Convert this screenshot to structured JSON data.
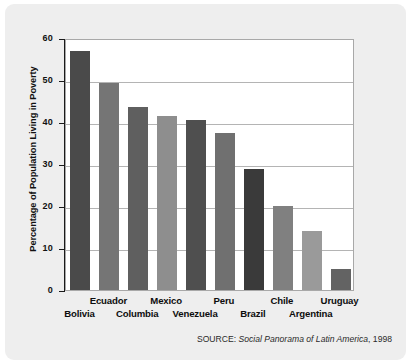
{
  "chart_data": {
    "type": "bar",
    "title": "",
    "xlabel": "",
    "ylabel": "Percentage of Population Living in Poverty",
    "ylim": [
      0,
      60
    ],
    "yticks": [
      "0",
      "10",
      "20",
      "30",
      "40",
      "50",
      "60"
    ],
    "grid": true,
    "legend": "none",
    "categories": [
      "Bolivia",
      "Ecuador",
      "Columbia",
      "Mexico",
      "Venezuela",
      "Peru",
      "Brazil",
      "Chile",
      "Argentina",
      "Uruguay"
    ],
    "values": [
      57.0,
      49.3,
      43.5,
      41.5,
      40.5,
      37.5,
      28.8,
      20.0,
      14.0,
      5.0
    ],
    "bar_colors": [
      "#4a4a4a",
      "#757575",
      "#5f5f5f",
      "#8e8e8e",
      "#4f4f4f",
      "#707070",
      "#3a3a3a",
      "#808080",
      "#9a9a9a",
      "#636363"
    ],
    "source": {
      "prefix": "SOURCE: ",
      "title": "Social Panorama of Latin America",
      "suffix": ", 1998"
    }
  },
  "labels": {
    "rows": [
      {
        "name": "Bolivia",
        "row": "bot"
      },
      {
        "name": "Ecuador",
        "row": "top"
      },
      {
        "name": "Columbia",
        "row": "bot"
      },
      {
        "name": "Mexico",
        "row": "top"
      },
      {
        "name": "Venezuela",
        "row": "bot"
      },
      {
        "name": "Peru",
        "row": "top"
      },
      {
        "name": "Brazil",
        "row": "bot"
      },
      {
        "name": "Chile",
        "row": "top"
      },
      {
        "name": "Argentina",
        "row": "bot"
      },
      {
        "name": "Uruguay",
        "row": "top"
      }
    ]
  },
  "style": {
    "card_bg": "#eeeeee",
    "panel_bg": "#ffffff",
    "grid_color": "#b4b4b4",
    "axis_color": "#1a1a1a",
    "text_color": "#111111"
  }
}
